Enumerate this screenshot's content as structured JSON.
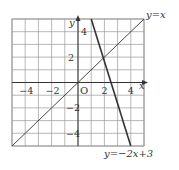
{
  "chart_data": {
    "type": "line",
    "title": "",
    "xlabel": "x",
    "ylabel": "y",
    "origin_label": "O",
    "xlim": [
      -5,
      5
    ],
    "ylim": [
      -5,
      5
    ],
    "grid": true,
    "grid_step": 1,
    "x_tick_labels": [
      "-4",
      "-2",
      "2",
      "4"
    ],
    "x_ticks": [
      -4,
      -2,
      2,
      4
    ],
    "y_tick_labels": [
      "4",
      "2",
      "-2",
      "-4"
    ],
    "y_ticks": [
      4,
      2,
      -2,
      -4
    ],
    "series": [
      {
        "name": "y=x",
        "label": "y=x",
        "equation": "y = x",
        "points": [
          [
            -5,
            -5
          ],
          [
            5,
            5
          ]
        ],
        "stroke_width": 0.9
      },
      {
        "name": "y=-2x+3",
        "label": "y=−2x+3",
        "equation": "y = -2x + 3",
        "points": [
          [
            1,
            5
          ],
          [
            4,
            -5
          ]
        ],
        "stroke_width": 1.6
      }
    ],
    "intersection": [
      1,
      1
    ]
  },
  "colors": {
    "grid": "#9a9a9a",
    "axis": "#333333",
    "line": "#333333",
    "background": "#ffffff"
  }
}
